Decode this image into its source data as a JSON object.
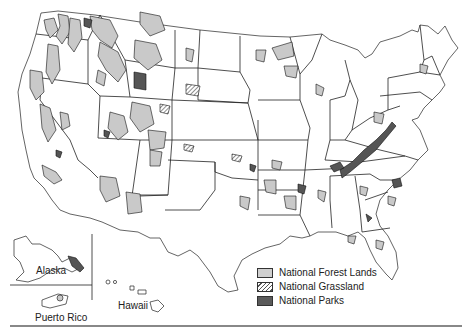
{
  "map": {
    "title": "National Forest Lands, National Grasslands and National Parks of the United States",
    "insets": {
      "alaska_label": "Alaska",
      "hawaii_label": "Hawaii",
      "puerto_rico_label": "Puerto Rico"
    },
    "colors": {
      "forest": "#c9c9c9",
      "park": "#555555",
      "grassland_hatch": "#555555",
      "boundary": "#222222"
    }
  },
  "legend": {
    "items": [
      {
        "label": "National Forest Lands",
        "symbol": "light-gray-fill"
      },
      {
        "label": "National Grassland",
        "symbol": "diagonal-hatch"
      },
      {
        "label": "National Parks",
        "symbol": "dark-gray-fill"
      }
    ]
  }
}
